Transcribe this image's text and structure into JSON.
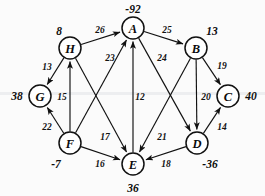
{
  "figure": {
    "cropped_header_text": "",
    "type": "directed-weighted-graph"
  },
  "chart_data": {
    "type": "diagram",
    "title": "",
    "nodes": [
      {
        "id": "A",
        "label": "A",
        "value": "-92",
        "cx": 133,
        "cy": 28,
        "r": 11,
        "value_x": 133,
        "value_y": 9
      },
      {
        "id": "B",
        "label": "B",
        "value": "13",
        "cx": 196,
        "cy": 48,
        "r": 11,
        "value_x": 212,
        "value_y": 31
      },
      {
        "id": "C",
        "label": "C",
        "value": "40",
        "cx": 228,
        "cy": 96,
        "r": 11,
        "value_x": 251,
        "value_y": 96
      },
      {
        "id": "D",
        "label": "D",
        "value": "-36",
        "cx": 197,
        "cy": 143,
        "r": 11,
        "value_x": 210,
        "value_y": 164
      },
      {
        "id": "E",
        "label": "E",
        "value": "36",
        "cx": 133,
        "cy": 164,
        "r": 11,
        "value_x": 133,
        "value_y": 188
      },
      {
        "id": "F",
        "label": "F",
        "value": "-7",
        "cx": 70,
        "cy": 143,
        "r": 11,
        "value_x": 56,
        "value_y": 164
      },
      {
        "id": "G",
        "label": "G",
        "value": "38",
        "cx": 40,
        "cy": 96,
        "r": 11,
        "value_x": 17,
        "value_y": 96
      },
      {
        "id": "H",
        "label": "H",
        "value": "8",
        "cx": 70,
        "cy": 48,
        "r": 11,
        "value_x": 59,
        "value_y": 31
      }
    ],
    "edges": [
      {
        "from": "H",
        "to": "A",
        "weight": "26",
        "lx": 100,
        "ly": 30
      },
      {
        "from": "A",
        "to": "B",
        "weight": "25",
        "lx": 167,
        "ly": 30
      },
      {
        "from": "H",
        "to": "G",
        "weight": "13",
        "lx": 47,
        "ly": 67
      },
      {
        "from": "B",
        "to": "C",
        "weight": "19",
        "lx": 222,
        "ly": 66
      },
      {
        "from": "F",
        "to": "H",
        "weight": "15",
        "lx": 62,
        "ly": 97
      },
      {
        "from": "B",
        "to": "D",
        "weight": "20",
        "lx": 206,
        "ly": 97
      },
      {
        "from": "F",
        "to": "A",
        "weight": "23",
        "lx": 110,
        "ly": 58
      },
      {
        "from": "A",
        "to": "D",
        "weight": "24",
        "lx": 162,
        "ly": 58
      },
      {
        "from": "E",
        "to": "A",
        "weight": "12",
        "lx": 140,
        "ly": 97
      },
      {
        "from": "F",
        "to": "G",
        "weight": "22",
        "lx": 47,
        "ly": 127
      },
      {
        "from": "D",
        "to": "C",
        "weight": "14",
        "lx": 222,
        "ly": 127
      },
      {
        "from": "H",
        "to": "E",
        "weight": "17",
        "lx": 105,
        "ly": 137
      },
      {
        "from": "B",
        "to": "E",
        "weight": "21",
        "lx": 162,
        "ly": 137
      },
      {
        "from": "F",
        "to": "E",
        "weight": "16",
        "lx": 100,
        "ly": 164
      },
      {
        "from": "D",
        "to": "E",
        "weight": "18",
        "lx": 166,
        "ly": 164
      }
    ]
  }
}
